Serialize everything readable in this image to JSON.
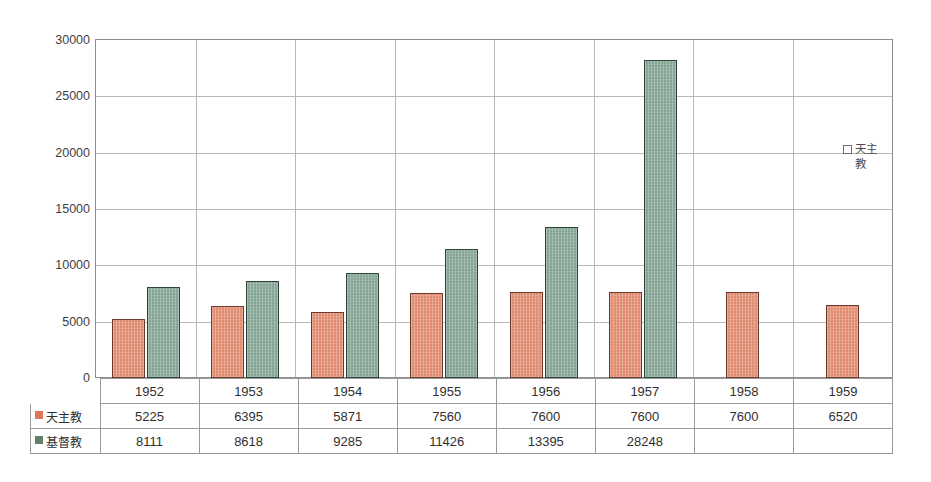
{
  "chart_data": {
    "type": "bar",
    "title": "",
    "xlabel": "",
    "ylabel": "",
    "categories": [
      "1952",
      "1953",
      "1954",
      "1955",
      "1956",
      "1957",
      "1958",
      "1959"
    ],
    "series": [
      {
        "name": "天主教",
        "color": "#e08b6f",
        "swatch_color": "#e0765a",
        "values": [
          5225,
          6395,
          5871,
          7560,
          7600,
          7600,
          7600,
          6520
        ]
      },
      {
        "name": "基督教",
        "color": "#84a494",
        "swatch_color": "#5f7f69",
        "values": [
          8111,
          8618,
          9285,
          11426,
          13395,
          28248,
          null,
          null
        ]
      }
    ],
    "ylim": [
      0,
      30000
    ],
    "y_ticks": [
      0,
      5000,
      10000,
      15000,
      20000,
      25000,
      30000
    ],
    "y_tick_labels": [
      "0",
      "5000",
      "10000",
      "15000",
      "20000",
      "25000",
      "30000"
    ],
    "grid": true,
    "legend_position": "inside-right",
    "legend_entries": [
      "天主教"
    ],
    "has_data_table": true
  },
  "plot_legend": {
    "marker": "open-square-marker",
    "label": "天主教"
  },
  "table": {
    "column_headers": [
      "1952",
      "1953",
      "1954",
      "1955",
      "1956",
      "1957",
      "1958",
      "1959"
    ],
    "rows": [
      {
        "label": "天主教",
        "swatch": "catholic",
        "cells": [
          "5225",
          "6395",
          "5871",
          "7560",
          "7600",
          "7600",
          "7600",
          "6520"
        ]
      },
      {
        "label": "基督教",
        "swatch": "protestant",
        "cells": [
          "8111",
          "8618",
          "9285",
          "11426",
          "13395",
          "28248",
          "",
          ""
        ]
      }
    ]
  },
  "axis": {
    "y_labels": [
      "30000",
      "25000",
      "20000",
      "15000",
      "10000",
      "5000",
      "0"
    ]
  }
}
